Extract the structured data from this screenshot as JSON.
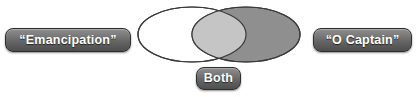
{
  "diagram": {
    "type": "venn",
    "title": "",
    "background_color": "#ffffff",
    "sets": [
      {
        "id": "left",
        "label": "“Emancipation”",
        "fill_color": "#ffffff",
        "stroke_color": "#3a3a3a"
      },
      {
        "id": "right",
        "label": "“O Captain”",
        "fill_color": "#8f8f8f",
        "stroke_color": "#3a3a3a"
      }
    ],
    "intersection": {
      "id": "both",
      "label": "Both",
      "fill_color": "#c5c5c5"
    },
    "label_style": {
      "text_color": "#ffffff",
      "gradient_top": "#8e8e8e",
      "gradient_bottom": "#4e4e4e",
      "border_color": "#2e2e2e"
    }
  }
}
